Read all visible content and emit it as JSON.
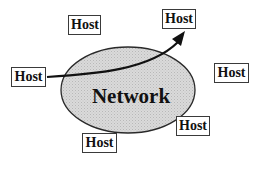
{
  "diagram": {
    "network": {
      "label": "Network",
      "fill": "#d4d4d4",
      "stroke": "#2a2a2a"
    },
    "hosts": [
      {
        "id": "host-top-left",
        "label": "Host"
      },
      {
        "id": "host-top-right",
        "label": "Host"
      },
      {
        "id": "host-left",
        "label": "Host"
      },
      {
        "id": "host-right",
        "label": "Host"
      },
      {
        "id": "host-bottom-right",
        "label": "Host"
      },
      {
        "id": "host-bottom-left",
        "label": "Host"
      }
    ],
    "arrow": {
      "from": "host-left",
      "to": "host-top-right",
      "color": "#111111"
    }
  }
}
